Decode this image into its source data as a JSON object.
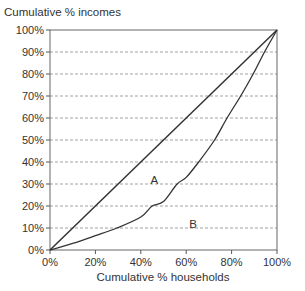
{
  "chart_data": {
    "type": "line",
    "title": "",
    "xlabel": "Cumulative % households",
    "ylabel": "Cumulative % incomes",
    "xlim": [
      0,
      100
    ],
    "ylim": [
      0,
      100
    ],
    "grid": {
      "horizontal": true,
      "vertical": false,
      "style": "dashed"
    },
    "legend": null,
    "x_ticks": [
      "0%",
      "20%",
      "40%",
      "60%",
      "80%",
      "100%"
    ],
    "y_ticks": [
      "0%",
      "10%",
      "20%",
      "30%",
      "40%",
      "50%",
      "60%",
      "70%",
      "80%",
      "90%",
      "100%"
    ],
    "series": [
      {
        "name": "Line of equality",
        "x": [
          0,
          100
        ],
        "y": [
          0,
          100
        ]
      },
      {
        "name": "Lorenz curve",
        "x": [
          0,
          10,
          20,
          29.5,
          40,
          45,
          50,
          56,
          60,
          65.5,
          72.5,
          78,
          84,
          89.5,
          94.5,
          100
        ],
        "y": [
          0,
          3,
          6.5,
          10,
          15,
          20,
          22,
          30,
          33,
          40,
          50,
          60,
          70,
          80,
          90,
          100
        ]
      }
    ],
    "annotations": [
      {
        "text": "A",
        "x": 46,
        "y": 32
      },
      {
        "text": "B",
        "x": 63,
        "y": 12
      }
    ]
  }
}
